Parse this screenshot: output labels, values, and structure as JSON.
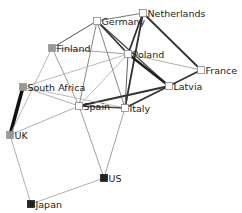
{
  "diagram": {
    "type": "network",
    "nodes": [
      {
        "id": "netherlands",
        "label": "Netherlands",
        "x": 143,
        "y": 13,
        "color": "#ffffff"
      },
      {
        "id": "germany",
        "label": "Germany",
        "x": 97,
        "y": 21,
        "color": "#ffffff"
      },
      {
        "id": "finland",
        "label": "Finland",
        "x": 52,
        "y": 48,
        "color": "#999999"
      },
      {
        "id": "poland",
        "label": "Poland",
        "x": 128,
        "y": 54,
        "color": "#ffffff"
      },
      {
        "id": "france",
        "label": "France",
        "x": 201,
        "y": 70,
        "color": "#ffffff"
      },
      {
        "id": "latvia",
        "label": "Latvia",
        "x": 169,
        "y": 86,
        "color": "#ffffff"
      },
      {
        "id": "south_africa",
        "label": "South Africa",
        "x": 23,
        "y": 87,
        "color": "#999999"
      },
      {
        "id": "spain",
        "label": "Spain",
        "x": 79,
        "y": 106,
        "color": "#ffffff"
      },
      {
        "id": "italy",
        "label": "Italy",
        "x": 125,
        "y": 108,
        "color": "#ffffff"
      },
      {
        "id": "uk",
        "label": "UK",
        "x": 10,
        "y": 135,
        "color": "#999999"
      },
      {
        "id": "us",
        "label": "US",
        "x": 104,
        "y": 178,
        "color": "#222222"
      },
      {
        "id": "japan",
        "label": "Japan",
        "x": 31,
        "y": 204,
        "color": "#222222"
      }
    ],
    "edges": [
      {
        "source": "south_africa",
        "target": "uk",
        "weight": 3.5,
        "color": "#111111"
      },
      {
        "source": "germany",
        "target": "netherlands",
        "weight": 1,
        "color": "#777777"
      },
      {
        "source": "germany",
        "target": "poland",
        "weight": 1.8,
        "color": "#333333"
      },
      {
        "source": "germany",
        "target": "latvia",
        "weight": 1.2,
        "color": "#444444"
      },
      {
        "source": "germany",
        "target": "finland",
        "weight": 1,
        "color": "#555555"
      },
      {
        "source": "germany",
        "target": "spain",
        "weight": 0.8,
        "color": "#666666"
      },
      {
        "source": "germany",
        "target": "italy",
        "weight": 0.8,
        "color": "#666666"
      },
      {
        "source": "netherlands",
        "target": "poland",
        "weight": 1.8,
        "color": "#333333"
      },
      {
        "source": "netherlands",
        "target": "italy",
        "weight": 1.8,
        "color": "#333333"
      },
      {
        "source": "netherlands",
        "target": "france",
        "weight": 1.8,
        "color": "#333333"
      },
      {
        "source": "finland",
        "target": "poland",
        "weight": 0.8,
        "color": "#888888"
      },
      {
        "source": "finland",
        "target": "spain",
        "weight": 0.8,
        "color": "#888888"
      },
      {
        "source": "finland",
        "target": "uk",
        "weight": 0.8,
        "color": "#aaaaaa"
      },
      {
        "source": "poland",
        "target": "latvia",
        "weight": 2.5,
        "color": "#222222"
      },
      {
        "source": "poland",
        "target": "france",
        "weight": 0.8,
        "color": "#999999"
      },
      {
        "source": "poland",
        "target": "spain",
        "weight": 0.8,
        "color": "#aaaaaa"
      },
      {
        "source": "poland",
        "target": "italy",
        "weight": 1,
        "color": "#666666"
      },
      {
        "source": "poland",
        "target": "south_africa",
        "weight": 0.8,
        "color": "#aaaaaa"
      },
      {
        "source": "france",
        "target": "latvia",
        "weight": 1.8,
        "color": "#333333"
      },
      {
        "source": "latvia",
        "target": "spain",
        "weight": 1.8,
        "color": "#333333"
      },
      {
        "source": "latvia",
        "target": "italy",
        "weight": 1.8,
        "color": "#333333"
      },
      {
        "source": "south_africa",
        "target": "spain",
        "weight": 0.8,
        "color": "#999999"
      },
      {
        "source": "south_africa",
        "target": "italy",
        "weight": 0.8,
        "color": "#aaaaaa"
      },
      {
        "source": "spain",
        "target": "italy",
        "weight": 1.5,
        "color": "#444444"
      },
      {
        "source": "spain",
        "target": "uk",
        "weight": 0.8,
        "color": "#999999"
      },
      {
        "source": "spain",
        "target": "us",
        "weight": 0.8,
        "color": "#888888"
      },
      {
        "source": "italy",
        "target": "us",
        "weight": 0.8,
        "color": "#888888"
      },
      {
        "source": "uk",
        "target": "japan",
        "weight": 0.8,
        "color": "#999999"
      },
      {
        "source": "us",
        "target": "japan",
        "weight": 0.8,
        "color": "#999999"
      }
    ]
  }
}
